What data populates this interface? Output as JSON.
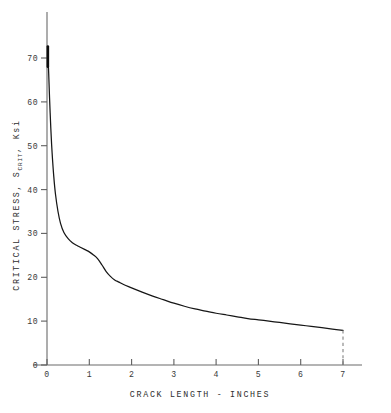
{
  "chart_data": {
    "type": "line",
    "title": "",
    "xlabel": "CRACK LENGTH - INCHES",
    "ylabel_full": "CRITICAL STRESS, SCRIT, Ksi",
    "ylabel_part1": "CRITICAL STRESS, S",
    "ylabel_subscript": "CRIT",
    "ylabel_part2": ", Ksi",
    "xlim": [
      0,
      7
    ],
    "ylim": [
      0,
      75
    ],
    "xticks": [
      0,
      1,
      2,
      3,
      4,
      5,
      6,
      7
    ],
    "xticklabels": [
      "0",
      "1",
      "2",
      "3",
      "4",
      "5",
      "6",
      "7"
    ],
    "yticks": [
      0,
      10,
      20,
      30,
      40,
      50,
      60,
      70
    ],
    "yticklabels": [
      "0",
      "10",
      "20",
      "30",
      "40",
      "50",
      "60",
      "70"
    ],
    "grid": false,
    "legend": null,
    "series": [
      {
        "name": "critical stress",
        "color": "#161616",
        "x": [
          0.02,
          0.04,
          0.06,
          0.09,
          0.12,
          0.16,
          0.2,
          0.26,
          0.32,
          0.4,
          0.5,
          0.6,
          0.7,
          0.8,
          0.9,
          1.0,
          1.1,
          1.2,
          1.3,
          1.4,
          1.5,
          1.6,
          1.7,
          1.8,
          2.0,
          2.25,
          2.5,
          2.75,
          3.0,
          3.25,
          3.5,
          3.75,
          4.0,
          4.25,
          4.5,
          4.75,
          5.0,
          5.25,
          5.5,
          5.75,
          6.0,
          6.25,
          6.5,
          6.75,
          7.0
        ],
        "y": [
          71.0,
          66.5,
          61.0,
          54.0,
          48.5,
          43.0,
          39.0,
          35.0,
          32.3,
          30.2,
          28.8,
          27.9,
          27.3,
          26.8,
          26.3,
          25.8,
          25.1,
          24.2,
          22.8,
          21.3,
          20.2,
          19.4,
          18.9,
          18.4,
          17.6,
          16.6,
          15.7,
          14.9,
          14.1,
          13.4,
          12.8,
          12.3,
          11.8,
          11.4,
          11.0,
          10.6,
          10.3,
          10.0,
          9.7,
          9.4,
          9.1,
          8.8,
          8.5,
          8.2,
          7.9
        ]
      }
    ],
    "annotations": [
      {
        "name": "end-drop-dashed-line",
        "type": "vline-dashed",
        "x": 7.0,
        "y_from": 7.9,
        "y_to": 0.0
      }
    ],
    "colors": {
      "background": "#ffffff",
      "curve": "#161616",
      "axis": "#6a6a6a",
      "text": "#2e2e2e"
    }
  }
}
